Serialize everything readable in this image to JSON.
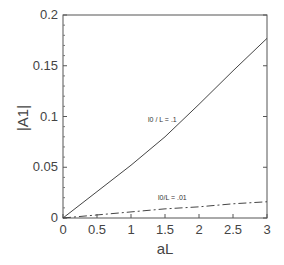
{
  "chart_data": {
    "type": "line",
    "title": "",
    "xlabel": "aL",
    "ylabel": "|A1|",
    "xlim": [
      0,
      3
    ],
    "ylim": [
      0,
      0.2
    ],
    "x_ticks": [
      "0",
      "0.5",
      "1",
      "1.5",
      "2",
      "2.5",
      "3"
    ],
    "y_ticks": [
      "0",
      "0.05",
      "0.1",
      "0.15",
      "0.2"
    ],
    "grid": false,
    "legend": "none (inline annotations)",
    "x": [
      0,
      0.5,
      1,
      1.5,
      2,
      2.5,
      3
    ],
    "series": [
      {
        "name": "l0/L = .1",
        "style": "solid",
        "values": [
          0,
          0.026,
          0.052,
          0.08,
          0.112,
          0.145,
          0.177
        ]
      },
      {
        "name": "l0/L = .01",
        "style": "dash-dot",
        "values": [
          0,
          0.003,
          0.006,
          0.009,
          0.011,
          0.014,
          0.016
        ]
      }
    ],
    "annotations": [
      {
        "text": "l0 / L = .1",
        "near_x": 1.4,
        "near_y": 0.1
      },
      {
        "text": "l0/L = .01",
        "near_x": 1.6,
        "near_y": 0.018
      }
    ]
  }
}
